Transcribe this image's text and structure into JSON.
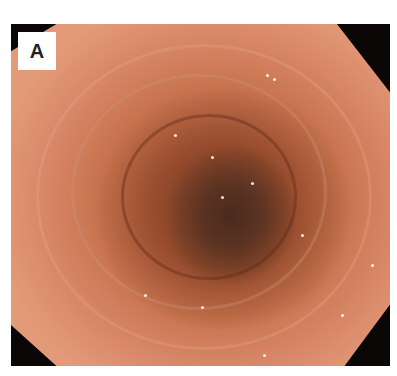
{
  "figure": {
    "panel_label": "A",
    "colors": {
      "background": "#ffffff",
      "frame": "#0a0606",
      "mucosa_outer": "#e39a78",
      "mucosa_mid": "#c8744f",
      "lumen_dark": "#4a2a1c",
      "label_bg": "#ffffff",
      "label_text": "#222222"
    }
  }
}
